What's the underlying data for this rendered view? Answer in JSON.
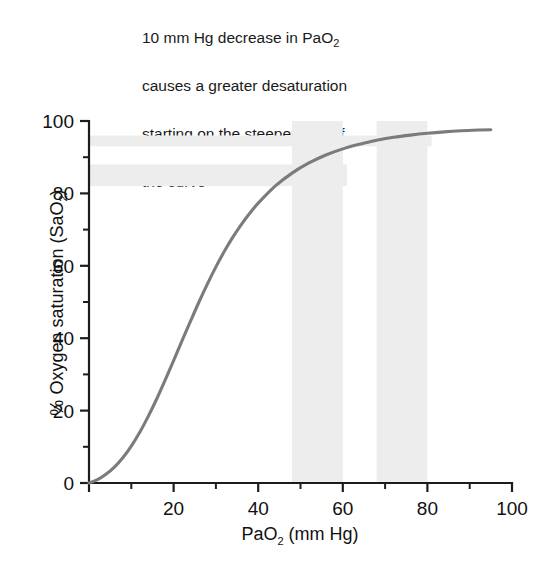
{
  "figure": {
    "annotation": {
      "lines": [
        "10 mm Hg decrease in PaO₂",
        "causes a greater desaturation",
        "starting on the steeper part of",
        "the curve"
      ],
      "line1_pre": "10 mm Hg decrease in PaO",
      "line1_sub": "2",
      "line2": "causes a greater desaturation",
      "line3": "starting on the steeper part of",
      "line4": "the curve"
    },
    "axis_titles": {
      "y_pre": "% Oxygen saturation (SaO",
      "y_sub": "2",
      "y_post": ")",
      "x_pre": "PaO",
      "x_sub": "2",
      "x_post": " (mm Hg)"
    },
    "colors": {
      "curve": "#7b7b7b",
      "band": "#ededed",
      "axis": "#1c1c1c",
      "text": "#111111",
      "background": "#ffffff"
    }
  },
  "chart_data": {
    "type": "line",
    "title": "10 mm Hg decrease in PaO2 causes a greater desaturation starting on the steeper part of the curve",
    "xlabel": "PaO2 (mm Hg)",
    "ylabel": "% Oxygen saturation (SaO2)",
    "xlim": [
      0,
      100
    ],
    "ylim": [
      0,
      100
    ],
    "grid": false,
    "legend": "none",
    "x_ticks_major": [
      0,
      20,
      40,
      60,
      80,
      100
    ],
    "x_tick_labels": [
      "0",
      "20",
      "40",
      "60",
      "80",
      "100"
    ],
    "x_ticks_minor": [
      10,
      30,
      50,
      70,
      90
    ],
    "y_ticks_major": [
      0,
      20,
      40,
      60,
      80,
      100
    ],
    "y_tick_labels": [
      "0",
      "20",
      "40",
      "60",
      "80",
      "100"
    ],
    "y_ticks_minor": [
      10,
      30,
      50,
      70,
      90
    ],
    "series": [
      {
        "name": "Oxyhemoglobin dissociation curve",
        "color": "#7b7b7b",
        "x": [
          0,
          2,
          4,
          6,
          8,
          10,
          12,
          14,
          16,
          18,
          20,
          22,
          24,
          26,
          28,
          30,
          32,
          34,
          36,
          38,
          40,
          44,
          48,
          52,
          56,
          60,
          64,
          68,
          72,
          76,
          80,
          84,
          88,
          92,
          95
        ],
        "y": [
          0,
          0.9,
          2.4,
          4.4,
          7.0,
          10.2,
          14.0,
          18.4,
          23.2,
          28.4,
          33.8,
          39.3,
          44.7,
          50.0,
          55.0,
          59.7,
          64.0,
          67.9,
          71.4,
          74.5,
          77.3,
          82.0,
          85.6,
          88.4,
          90.6,
          92.3,
          93.6,
          94.7,
          95.5,
          96.1,
          96.6,
          97.0,
          97.3,
          97.5,
          97.6
        ]
      }
    ],
    "highlight_bands_x": [
      {
        "label": "PaO2 48-60 mm Hg",
        "from": 48,
        "to": 60,
        "color": "#ededed"
      },
      {
        "label": "PaO2 68-80 mm Hg",
        "from": 68,
        "to": 80,
        "color": "#ededed"
      }
    ],
    "highlight_bands_y": [
      {
        "label": "SaO2 93-96 %",
        "from": 93,
        "to": 96,
        "x_from": 0,
        "x_to": 81,
        "color": "#ededed"
      },
      {
        "label": "SaO2 82-88 %",
        "from": 82,
        "to": 88,
        "x_from": 0,
        "x_to": 61,
        "color": "#ededed"
      }
    ],
    "annotations": [
      {
        "text": "10 mm Hg decrease in PaO2 causes a greater desaturation starting on the steeper part of the curve",
        "position": "top-center"
      }
    ]
  }
}
